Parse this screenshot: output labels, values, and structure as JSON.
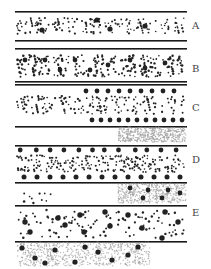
{
  "panels": [
    {
      "label": "A",
      "label_y": 21
    },
    {
      "label": "B",
      "label_y": 64
    },
    {
      "label": "C",
      "label_y": 103
    },
    {
      "label": "D",
      "label_y": 155
    },
    {
      "label": "E",
      "label_y": 208
    }
  ],
  "colors": {
    "line": "#1a1a1a",
    "particle": "#222222",
    "cloud": "#9a9a9a"
  }
}
